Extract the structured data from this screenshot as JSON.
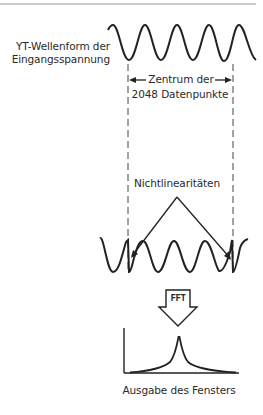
{
  "labels": {
    "input_waveform_line1": "YT-Wellenform der",
    "input_waveform_line2": "Eingangsspannung",
    "center_line1": "Zentrum der",
    "center_line2": "2048 Datenpunkte",
    "nonlinearities": "Nichtlinearitäten",
    "fft": "FFT",
    "window_output": "Ausgabe des Fensters"
  },
  "colors": {
    "stroke": "#222222",
    "text": "#2a2a2a",
    "dashed": "#444444",
    "top_rule": "#9a9a9a"
  },
  "icons": {
    "fft_arrow": "down-block-arrow-icon",
    "double_arrow": "left-right-arrow-icon"
  }
}
